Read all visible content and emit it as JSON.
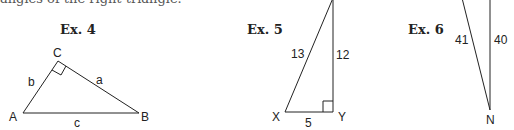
{
  "header": {
    "text": "angles of the right triangle."
  },
  "examples": [
    {
      "title": "Ex. 4",
      "vertices": {
        "A": "A",
        "B": "B",
        "C": "C"
      },
      "sides": {
        "a": "a",
        "b": "b",
        "c": "c"
      },
      "right_angle_at": "C"
    },
    {
      "title": "Ex. 5",
      "vertices": {
        "X": "X",
        "Y": "Y"
      },
      "sides": {
        "hypotenuse": "13",
        "vertical": "12",
        "base": "5"
      },
      "right_angle_at": "Y"
    },
    {
      "title": "Ex. 6",
      "vertices": {
        "N": "N"
      },
      "sides": {
        "hypotenuse": "41",
        "vertical": "40"
      }
    }
  ]
}
